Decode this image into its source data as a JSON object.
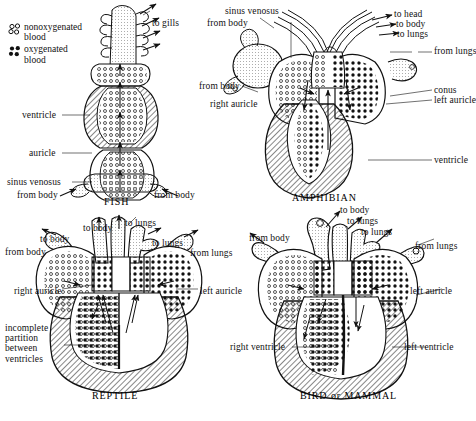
{
  "figure": {
    "colors": {
      "ink": "#111111",
      "background": "#ffffff",
      "oxygenated_blood": "#000000",
      "nonoxygenated_blood": "#ffffff",
      "muscle_wall_hatch": "#111111"
    }
  },
  "legend": {
    "items": [
      {
        "symbol": "open-circles",
        "line1": "nonoxygenated",
        "line2": "blood"
      },
      {
        "symbol": "filled-circles",
        "line1": "oxygenated",
        "line2": "blood"
      }
    ]
  },
  "panels": [
    {
      "id": "fish",
      "caption": "FISH",
      "labels": [
        {
          "text": "to gills",
          "name": "label-to-gills"
        },
        {
          "text": "ventricle",
          "name": "label-ventricle"
        },
        {
          "text": "auricle",
          "name": "label-auricle"
        },
        {
          "text": "sinus venosus",
          "name": "label-sinus-venosus"
        },
        {
          "text": "from body",
          "name": "label-from-body-left"
        },
        {
          "text": "from body",
          "name": "label-from-body-right"
        }
      ]
    },
    {
      "id": "amphibian",
      "caption": "AMPHIBIAN",
      "labels": [
        {
          "text": "sinus venosus",
          "name": "label-sinus-venosus"
        },
        {
          "text": "from body",
          "name": "label-from-body-upper"
        },
        {
          "text": "from body",
          "name": "label-from-body-lower"
        },
        {
          "text": "right auricle",
          "name": "label-right-auricle"
        },
        {
          "text": "to head",
          "name": "label-to-head"
        },
        {
          "text": "to body",
          "name": "label-to-body"
        },
        {
          "text": "to lungs",
          "name": "label-to-lungs"
        },
        {
          "text": "from lungs",
          "name": "label-from-lungs"
        },
        {
          "text": "conus",
          "name": "label-conus"
        },
        {
          "text": "left auricle",
          "name": "label-left-auricle"
        },
        {
          "text": "ventricle",
          "name": "label-ventricle"
        }
      ]
    },
    {
      "id": "reptile",
      "caption": "REPTILE",
      "labels": [
        {
          "text": "to body",
          "name": "label-to-body-center"
        },
        {
          "text": "to lungs",
          "name": "label-to-lungs-center"
        },
        {
          "text": "to body",
          "name": "label-to-body-left"
        },
        {
          "text": "to lungs",
          "name": "label-to-lungs-right"
        },
        {
          "text": "from body",
          "name": "label-from-body"
        },
        {
          "text": "from lungs",
          "name": "label-from-lungs"
        },
        {
          "text": "right auricle",
          "name": "label-right-auricle"
        },
        {
          "text": "left auricle",
          "name": "label-left-auricle"
        },
        {
          "text": "incomplete partition between ventricles",
          "name": "label-incomplete-partition"
        }
      ]
    },
    {
      "id": "bird",
      "caption": "BIRD or MAMMAL",
      "labels": [
        {
          "text": "to body",
          "name": "label-to-body"
        },
        {
          "text": "to lungs",
          "name": "label-to-lungs-upper"
        },
        {
          "text": "to lungs",
          "name": "label-to-lungs-lower"
        },
        {
          "text": "from body",
          "name": "label-from-body"
        },
        {
          "text": "from lungs",
          "name": "label-from-lungs"
        },
        {
          "text": "left auricle",
          "name": "label-left-auricle"
        },
        {
          "text": "right ventricle",
          "name": "label-right-ventricle"
        },
        {
          "text": "left ventricle",
          "name": "label-left-ventricle"
        }
      ]
    }
  ]
}
